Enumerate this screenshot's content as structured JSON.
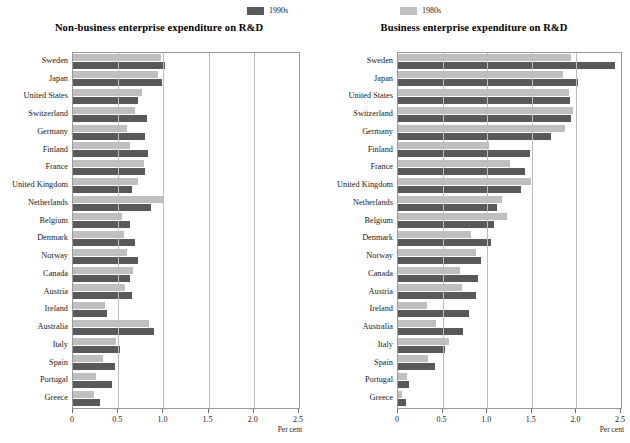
{
  "legend": {
    "items": [
      {
        "label": "1990s",
        "color": "#59595b",
        "name": "legend-1990s"
      },
      {
        "label": "1980s",
        "color": "#bfbfbf",
        "name": "legend-1980s"
      }
    ]
  },
  "colors": {
    "series_1990s": "#59595b",
    "series_1980s": "#bfbfbf",
    "plot_border": "#9a9a9a",
    "gridline": "#bdbdbd"
  },
  "chart_data": [
    {
      "type": "bar",
      "orientation": "horizontal",
      "title": "Non-business enterprise expenditure on R&D",
      "xlabel": "Per cent",
      "ylabel": "",
      "xlim": [
        0,
        2.5
      ],
      "xticks": [
        0,
        0.5,
        1.0,
        1.5,
        2.0,
        2.5
      ],
      "xticklabels": [
        "0",
        "0.5",
        "1.0",
        "1.5",
        "2.0",
        "2.5"
      ],
      "grid": true,
      "legend_position": "top",
      "categories": [
        "Sweden",
        "Japan",
        "United States",
        "Switzerland",
        "Germany",
        "Finland",
        "France",
        "United Kingdom",
        "Netherlands",
        "Belgium",
        "Denmark",
        "Norway",
        "Canada",
        "Austria",
        "Ireland",
        "Australia",
        "Italy",
        "Spain",
        "Portugal",
        "Greece"
      ],
      "series": [
        {
          "name": "1980s",
          "color": "#bfbfbf",
          "values": [
            0.97,
            0.94,
            0.76,
            0.69,
            0.6,
            0.63,
            0.78,
            0.72,
            1.0,
            0.54,
            0.56,
            0.6,
            0.66,
            0.57,
            0.35,
            0.84,
            0.48,
            0.33,
            0.25,
            0.23
          ]
        },
        {
          "name": "1990s",
          "color": "#59595b",
          "values": [
            1.02,
            0.98,
            0.72,
            0.82,
            0.8,
            0.83,
            0.8,
            0.65,
            0.86,
            0.63,
            0.69,
            0.72,
            0.63,
            0.65,
            0.38,
            0.9,
            0.52,
            0.47,
            0.43,
            0.3
          ]
        }
      ]
    },
    {
      "type": "bar",
      "orientation": "horizontal",
      "title": "Business enterprise expenditure on R&D",
      "xlabel": "Per cent",
      "ylabel": "",
      "xlim": [
        0,
        2.5
      ],
      "xticks": [
        0,
        0.5,
        1.0,
        1.5,
        2.0,
        2.5
      ],
      "xticklabels": [
        "0",
        "0.5",
        "1.0",
        "1.5",
        "2.0",
        "2.5"
      ],
      "grid": true,
      "legend_position": "top",
      "categories": [
        "Sweden",
        "Japan",
        "United States",
        "Switzerland",
        "Germany",
        "Finland",
        "France",
        "United Kingdom",
        "Netherlands",
        "Belgium",
        "Denmark",
        "Norway",
        "Canada",
        "Austria",
        "Ireland",
        "Australia",
        "Italy",
        "Spain",
        "Portugal",
        "Greece"
      ],
      "series": [
        {
          "name": "1980s",
          "color": "#bfbfbf",
          "values": [
            1.94,
            1.85,
            1.92,
            1.96,
            1.87,
            1.02,
            1.26,
            1.49,
            1.17,
            1.22,
            0.82,
            0.87,
            0.7,
            0.72,
            0.32,
            0.43,
            0.57,
            0.34,
            0.1,
            0.04
          ]
        },
        {
          "name": "1990s",
          "color": "#59595b",
          "values": [
            2.43,
            2.02,
            1.93,
            1.94,
            1.71,
            1.48,
            1.42,
            1.38,
            1.11,
            1.08,
            1.04,
            0.93,
            0.9,
            0.88,
            0.8,
            0.73,
            0.53,
            0.41,
            0.12,
            0.09
          ]
        }
      ]
    }
  ]
}
